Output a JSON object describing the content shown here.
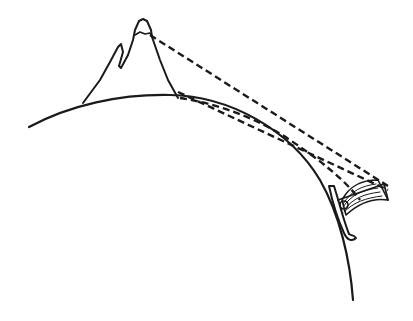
{
  "diagram": {
    "elements": [
      {
        "id": "earth-surface",
        "kind": "curve"
      },
      {
        "id": "mountain",
        "kind": "illustration"
      },
      {
        "id": "sight-line-peak",
        "kind": "dashed-line",
        "from": [
          141,
          36
        ],
        "to": [
          387,
          185
        ]
      },
      {
        "id": "sight-line-base",
        "kind": "dashed-line",
        "from": [
          178,
          97
        ],
        "to": [
          387,
          190
        ]
      },
      {
        "id": "ship",
        "kind": "illustration"
      }
    ],
    "colors": {
      "line": "#1a1a1a",
      "background": "#ffffff"
    }
  }
}
